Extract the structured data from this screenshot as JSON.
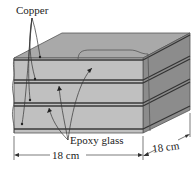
{
  "figure": {
    "labels": {
      "copper": "Copper",
      "epoxy": "Epoxy glass",
      "width": "18 cm",
      "depth": "18 cm"
    },
    "colors": {
      "front_face": "#bdbdbd",
      "top_face": "#a8a8a8",
      "side_face": "#8a8a8a",
      "copper_line": "#3a3a3a",
      "edge": "#444444",
      "text": "#222222"
    },
    "layers": {
      "copper_count": 4,
      "epoxy_count": 3
    }
  }
}
